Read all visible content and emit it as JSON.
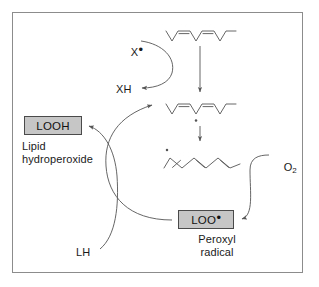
{
  "figure": {
    "background_color": "#ffffff",
    "frame_color": "#8c8c8c",
    "line_color": "#555555",
    "box_fill_color": "#c6c6c6",
    "box_border_color": "#4a4a4a",
    "text_color": "#1a1a1a"
  },
  "species": {
    "initiator_radical": "X",
    "initiator_radical_dot": "•",
    "abstracted_hydrogen": "XH",
    "oxygen": "O",
    "oxygen_subscript": "2",
    "lipid_substrate": "LH"
  },
  "boxes": [
    {
      "id": "looh",
      "label": "LOOH",
      "caption": "Lipid\nhydroperoxide"
    },
    {
      "id": "loo",
      "label": "LOO",
      "label_dot": "•",
      "caption": "Peroxyl\nradical"
    }
  ],
  "structures": [
    {
      "id": "polyunsaturated-lipid",
      "description": "polyunsaturated fatty acid chain, zigzag with two double bonds"
    },
    {
      "id": "lipid-radical",
      "description": "carbon-centred lipid radical with radical dot below chain"
    },
    {
      "id": "conjugated-diene-radical",
      "description": "rearranged conjugated diene lipid radical with radical dot at left"
    }
  ],
  "arrows": [
    {
      "id": "x-to-xh",
      "from": "X•",
      "to": "XH",
      "style": "curved"
    },
    {
      "id": "lipid-to-radical",
      "from": "polyunsaturated-lipid",
      "to": "lipid-radical",
      "style": "straight-down"
    },
    {
      "id": "radical-to-diene",
      "from": "lipid-radical",
      "to": "conjugated-diene-radical",
      "style": "straight-down"
    },
    {
      "id": "o2-to-loo",
      "from": "O2",
      "to": "LOO•",
      "style": "curved"
    },
    {
      "id": "loo-to-lipid-radical",
      "from": "LOO•",
      "to": "lipid-radical",
      "style": "curved"
    },
    {
      "id": "lh-to-looh",
      "from": "LH",
      "to": "LOOH",
      "style": "curved"
    }
  ]
}
